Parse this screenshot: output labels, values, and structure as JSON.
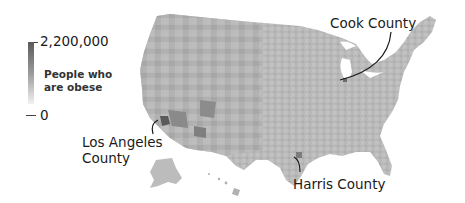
{
  "legend": {
    "max_label": "2,200,000",
    "min_label": "0",
    "title_line1": "People who",
    "title_line2": "are obese",
    "color_high": "#5a5a5a",
    "color_low": "#f2f2f2"
  },
  "annotations": [
    {
      "label": "Cook County"
    },
    {
      "label_line1": "Los Angeles",
      "label_line2": "County"
    },
    {
      "label": "Harris County"
    }
  ],
  "map": {
    "type": "choropleth",
    "region": "United States counties",
    "fill_color": "#b4b4b4"
  }
}
